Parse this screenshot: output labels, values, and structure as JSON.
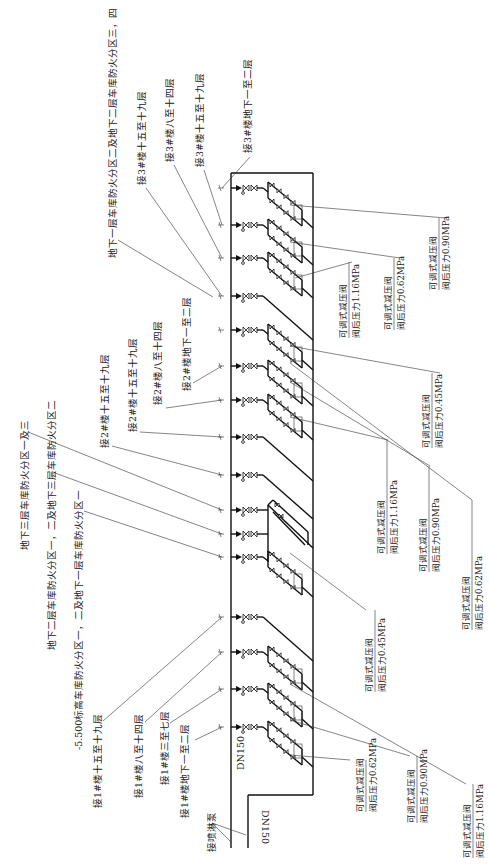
{
  "diagram": {
    "type": "sprinkler alarm-valve / pressure-reducing-valve riser schematic (rotated 90°)",
    "pipe_size_main": "DN150",
    "pipe_size_return": "DN150",
    "pump_connection_label": "接喷淋泵"
  },
  "left_labels": [
    {
      "id": "l1",
      "text": "地下一层车库防火分区二及地下二层车库防火分区三，四"
    },
    {
      "id": "l2",
      "text": "接3#楼十五至十九层"
    },
    {
      "id": "l3",
      "text": "接3#楼八至十四层"
    },
    {
      "id": "l4",
      "text": "接3#楼十五至十九层"
    },
    {
      "id": "l5",
      "text": "接3#楼地下一至二层"
    },
    {
      "id": "l6",
      "text": "接2#楼地下一至二层"
    },
    {
      "id": "l7",
      "text": "接2#楼八至十四层"
    },
    {
      "id": "l8",
      "text": "接2#楼十五至十九层"
    },
    {
      "id": "l9",
      "text": "接2#楼十五至十九层"
    },
    {
      "id": "l10",
      "text": "地下三层车库防火分区一及三"
    },
    {
      "id": "l11",
      "text": "地下二层车库防火分区一，二及地下三层车库防火分区二"
    },
    {
      "id": "l12",
      "text": "-5.500标高车库防火分区一，二及地下一层车库防火分区一"
    },
    {
      "id": "l13",
      "text": "接1#楼十五至十九层"
    },
    {
      "id": "l14",
      "text": "接1#楼八至十四层"
    },
    {
      "id": "l15",
      "text": "接1#楼三至七层"
    },
    {
      "id": "l16",
      "text": "接1#楼地下一至二层"
    }
  ],
  "valve_callouts": [
    {
      "id": "v1",
      "name": "可调式减压阀",
      "pressure": "阀后压力0.90MPa"
    },
    {
      "id": "v2",
      "name": "可调式减压阀",
      "pressure": "阀后压力0.62MPa"
    },
    {
      "id": "v3",
      "name": "可调式减压阀",
      "pressure": "阀后压力1.16MPa"
    },
    {
      "id": "v4",
      "name": "可调式减压阀",
      "pressure": "阀后压力0.45MPa"
    },
    {
      "id": "v5",
      "name": "可调式减压阀",
      "pressure": "阀后压力1.16MPa"
    },
    {
      "id": "v6",
      "name": "可调式减压阀",
      "pressure": "阀后压力0.90MPa"
    },
    {
      "id": "v7",
      "name": "可调式减压阀",
      "pressure": "阀后压力0.62MPa"
    },
    {
      "id": "v8",
      "name": "可调式减压阀",
      "pressure": "阀后压力0.45MPa"
    },
    {
      "id": "v9",
      "name": "可调式减压阀",
      "pressure": "阀后压力0.62MPa"
    },
    {
      "id": "v10",
      "name": "可调式减压阀",
      "pressure": "阀后压力0.90MPa"
    },
    {
      "id": "v11",
      "name": "可调式减压阀",
      "pressure": "阀后压力1.16MPa"
    }
  ]
}
